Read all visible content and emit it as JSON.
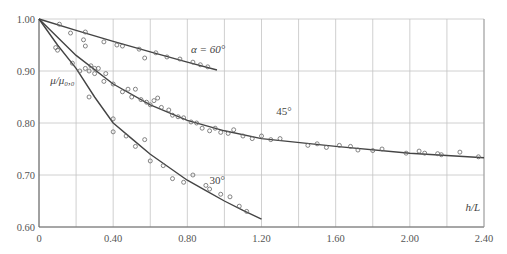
{
  "chart_data": {
    "type": "scatter",
    "title": "",
    "xlabel": "h/L",
    "ylabel": "μ/μ₀,₀",
    "xlim": [
      0,
      2.4
    ],
    "ylim": [
      0.6,
      1.0
    ],
    "x_ticks": [
      0,
      0.4,
      0.8,
      1.2,
      1.6,
      2.0,
      2.4
    ],
    "x_tick_labels": [
      "0",
      "0.40",
      "0.80",
      "1.20",
      "1.60",
      "2.00",
      "2.40"
    ],
    "y_ticks": [
      0.6,
      0.7,
      0.8,
      0.9,
      1.0
    ],
    "y_tick_labels": [
      "0.60",
      "0.70",
      "0.80",
      "0.90",
      "1.00"
    ],
    "grid": {
      "x_step": 0.2,
      "y_step": 0.1,
      "on": true
    },
    "legend": "none",
    "annotations": [
      {
        "text": "α = 60°",
        "x": 0.82,
        "y": 0.935
      },
      {
        "text": "45°",
        "x": 1.28,
        "y": 0.815
      },
      {
        "text": "30°",
        "x": 0.92,
        "y": 0.683
      },
      {
        "text": "μ/μ₀,₀",
        "x": 0.06,
        "y": 0.875
      },
      {
        "text": "h/L",
        "x": 2.3,
        "y": 0.63
      }
    ],
    "series": [
      {
        "name": "α = 60° (fit)",
        "kind": "line",
        "x": [
          0,
          0.2,
          0.4,
          0.6,
          0.8,
          0.96
        ],
        "y": [
          1.0,
          0.978,
          0.957,
          0.937,
          0.917,
          0.902
        ]
      },
      {
        "name": "α = 60° (data)",
        "kind": "points",
        "x": [
          0.11,
          0.17,
          0.25,
          0.24,
          0.25,
          0.35,
          0.42,
          0.45,
          0.54,
          0.63,
          0.57,
          0.69,
          0.76,
          0.83,
          0.87,
          0.91
        ],
        "y": [
          0.99,
          0.973,
          0.975,
          0.96,
          0.948,
          0.956,
          0.95,
          0.948,
          0.942,
          0.935,
          0.925,
          0.927,
          0.923,
          0.917,
          0.912,
          0.908
        ]
      },
      {
        "name": "α = 45° (fit)",
        "kind": "line",
        "x": [
          0,
          0.2,
          0.4,
          0.6,
          0.8,
          1.0,
          1.2,
          1.6,
          2.0,
          2.4
        ],
        "y": [
          1.0,
          0.93,
          0.875,
          0.835,
          0.805,
          0.785,
          0.77,
          0.755,
          0.742,
          0.733
        ]
      },
      {
        "name": "α = 45° (data)",
        "kind": "points",
        "x": [
          0.09,
          0.1,
          0.18,
          0.25,
          0.27,
          0.28,
          0.3,
          0.3,
          0.32,
          0.35,
          0.36,
          0.4,
          0.45,
          0.48,
          0.5,
          0.52,
          0.55,
          0.58,
          0.6,
          0.62,
          0.64,
          0.66,
          0.7,
          0.72,
          0.75,
          0.78,
          0.82,
          0.85,
          0.88,
          0.92,
          0.95,
          0.98,
          1.02,
          1.05,
          1.1,
          1.15,
          1.2,
          1.25,
          1.3,
          1.45,
          1.5,
          1.55,
          1.62,
          1.68,
          1.72,
          1.8,
          1.85,
          1.98,
          2.05,
          2.08,
          2.15,
          2.17,
          2.27,
          2.37
        ],
        "y": [
          0.945,
          0.94,
          0.915,
          0.905,
          0.9,
          0.91,
          0.905,
          0.895,
          0.905,
          0.88,
          0.895,
          0.875,
          0.86,
          0.865,
          0.85,
          0.865,
          0.845,
          0.84,
          0.835,
          0.843,
          0.848,
          0.83,
          0.825,
          0.815,
          0.812,
          0.81,
          0.802,
          0.8,
          0.79,
          0.785,
          0.79,
          0.782,
          0.78,
          0.787,
          0.775,
          0.77,
          0.775,
          0.768,
          0.77,
          0.757,
          0.76,
          0.753,
          0.757,
          0.755,
          0.748,
          0.747,
          0.75,
          0.742,
          0.746,
          0.742,
          0.741,
          0.739,
          0.744,
          0.735
        ]
      },
      {
        "name": "α = 30° (fit)",
        "kind": "line",
        "x": [
          0,
          0.1,
          0.2,
          0.3,
          0.4,
          0.5,
          0.6,
          0.7,
          0.8,
          0.9,
          1.0,
          1.1,
          1.2
        ],
        "y": [
          1.0,
          0.95,
          0.905,
          0.85,
          0.8,
          0.77,
          0.74,
          0.715,
          0.69,
          0.67,
          0.65,
          0.632,
          0.615
        ]
      },
      {
        "name": "α = 30° (data)",
        "kind": "points",
        "x": [
          0.22,
          0.27,
          0.4,
          0.4,
          0.47,
          0.52,
          0.57,
          0.6,
          0.67,
          0.72,
          0.78,
          0.83,
          0.9,
          0.92,
          0.98,
          1.03,
          1.08,
          1.12
        ],
        "y": [
          0.9,
          0.85,
          0.808,
          0.783,
          0.775,
          0.755,
          0.768,
          0.727,
          0.718,
          0.693,
          0.686,
          0.7,
          0.68,
          0.673,
          0.663,
          0.658,
          0.64,
          0.63
        ]
      }
    ]
  }
}
